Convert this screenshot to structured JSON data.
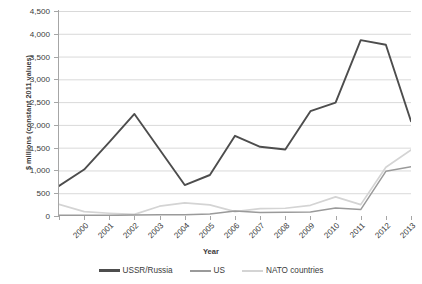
{
  "chart_data": {
    "type": "line",
    "title": "",
    "xlabel": "Year",
    "ylabel": "$ millions (constant 2011 values)",
    "x": [
      2000,
      2001,
      2002,
      2003,
      2004,
      2005,
      2006,
      2007,
      2008,
      2009,
      2010,
      2011,
      2012,
      2013,
      2014
    ],
    "categories": [
      "2000",
      "2001",
      "2002",
      "2003",
      "2004",
      "2005",
      "2006",
      "2007",
      "2008",
      "2009",
      "2010",
      "2011",
      "2012",
      "2013",
      "2014"
    ],
    "ylim": [
      0,
      4500
    ],
    "yticks": [
      0,
      500,
      1000,
      1500,
      2000,
      2500,
      3000,
      3500,
      4000,
      4500
    ],
    "ytick_labels": [
      "0",
      "500",
      "1,000",
      "1,500",
      "2,000",
      "2,500",
      "3,000",
      "3,500",
      "4,000",
      "4,500"
    ],
    "grid": true,
    "legend_position": "bottom",
    "series": [
      {
        "name": "USSR/Russia",
        "color": "#4d4d4d",
        "width": 1.9,
        "values": [
          660,
          1020,
          1620,
          2240,
          1460,
          680,
          900,
          1760,
          1520,
          1460,
          2300,
          2490,
          3860,
          3760,
          2080
        ]
      },
      {
        "name": "US",
        "color": "#9a9a9a",
        "width": 1.5,
        "values": [
          15,
          15,
          15,
          20,
          25,
          30,
          45,
          110,
          75,
          80,
          90,
          175,
          140,
          980,
          1080
        ]
      },
      {
        "name": "NATO countries",
        "color": "#d4d4d4",
        "width": 1.7,
        "values": [
          255,
          95,
          60,
          35,
          215,
          290,
          245,
          95,
          160,
          170,
          235,
          420,
          250,
          1070,
          1450
        ]
      }
    ]
  },
  "legend": {
    "items": [
      {
        "label": "USSR/Russia",
        "color": "#4d4d4d"
      },
      {
        "label": "US",
        "color": "#9a9a9a"
      },
      {
        "label": "NATO countries",
        "color": "#d4d4d4"
      }
    ]
  },
  "axes": {
    "y_title": "$ millions (constant 2011 values)",
    "x_title": "Year"
  },
  "colors": {
    "gridline": "#d9d9d9",
    "axis": "#a6a6a6",
    "text": "#3b3b3b",
    "background": "#ffffff"
  }
}
